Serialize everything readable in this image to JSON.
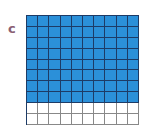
{
  "label": "c",
  "grid": {
    "rows": 10,
    "cols": 10,
    "filled_rows": 8,
    "filled_cells": 80,
    "total_cells": 100,
    "fill_color": "#2b90d9",
    "empty_color": "#ffffff",
    "filled_line_color": "#1d3b66",
    "empty_line_color": "#888888"
  }
}
